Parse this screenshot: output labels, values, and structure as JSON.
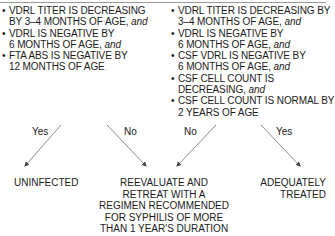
{
  "criteria": {
    "left": {
      "items": [
        {
          "text": "VDRL TITER IS DECREASING BY 3–4 MONTHS OF AGE,",
          "conj": "and"
        },
        {
          "text": "VDRL IS NEGATIVE BY 6 MONTHS OF AGE,",
          "conj": "and"
        },
        {
          "text": "FTA ABS IS NEGATIVE BY 12 MONTHS OF AGE",
          "conj": ""
        }
      ]
    },
    "right": {
      "items": [
        {
          "text": "VDRL TITER IS DECREASING BY 3–4 MONTHS OF AGE,",
          "conj": "and"
        },
        {
          "text": "VDRL IS NEGATIVE BY 6 MONTHS OF AGE,",
          "conj": "and"
        },
        {
          "text": "CSF VDRL IS NEGATIVE BY 6 MONTHS OF AGE,",
          "conj": "and"
        },
        {
          "text": "CSF CELL COUNT IS DECREASING,",
          "conj": "and"
        },
        {
          "text": "CSF CELL COUNT IS NORMAL BY 2 YEARS OF AGE",
          "conj": ""
        }
      ]
    }
  },
  "branches": [
    {
      "label": "Yes",
      "from": "left",
      "to": "uninfected"
    },
    {
      "label": "No",
      "from": "left",
      "to": "retreat"
    },
    {
      "label": "No",
      "from": "right",
      "to": "retreat"
    },
    {
      "label": "Yes",
      "from": "right",
      "to": "treated"
    }
  ],
  "outcomes": {
    "uninfected": "UNINFECTED",
    "retreat": "REEVALUATE AND RETREAT WITH A REGIMEN RECOMMENDED FOR SYPHILIS OF MORE THAN 1 YEAR'S DURATION",
    "treated": "ADEQUATELY TREATED"
  },
  "colors": {
    "text": "#1a1a1a",
    "arrow": "#8c8c8c",
    "rule": "#9a9a9a"
  }
}
